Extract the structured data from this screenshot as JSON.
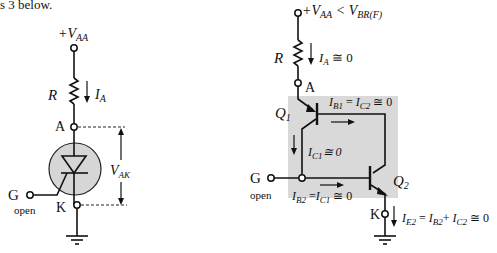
{
  "header_fragment": "s 3 below.",
  "left_circuit": {
    "supply_label": "+V",
    "supply_sub": "AA",
    "resistor_label": "R",
    "current_label": "I",
    "current_sub": "A",
    "anode_label": "A",
    "cathode_label": "K",
    "gate_label": "G",
    "gate_state": "open",
    "voltage_label": "V",
    "voltage_sub": "AK",
    "device_fill": "#d6d6d6"
  },
  "right_circuit": {
    "supply_label": "+V",
    "supply_sub": "AA",
    "supply_cond": " < V",
    "supply_cond_sub": "BR(F)",
    "resistor_label": "R",
    "current_label": "I",
    "current_sub": "A",
    "current_value": " ≅ 0",
    "anode_label": "A",
    "q1_label": "Q",
    "q1_sub": "1",
    "q2_label": "Q",
    "q2_sub": "2",
    "ib1_eq": {
      "a": "I",
      "a_sub": "B1",
      "mid": " = ",
      "b": "I",
      "b_sub": "C2",
      "tail": " ≅ 0"
    },
    "ic1_eq": {
      "a": "I",
      "a_sub": "C1",
      "tail": "≅ 0"
    },
    "ib2_eq": {
      "a": "I",
      "a_sub": "B2",
      "mid": " =",
      "b": "I",
      "b_sub": "C1",
      "tail": " ≅ 0"
    },
    "ie2_eq": {
      "a": "I",
      "a_sub": "E2",
      "mid": " = ",
      "b": "I",
      "b_sub": "B2",
      "mid2": "+ ",
      "c": "I",
      "c_sub": "C2",
      "tail": " ≅ 0"
    },
    "gate_label": "G",
    "gate_state": "open",
    "cathode_label": "K",
    "shade_fill": "#d9d9d9"
  }
}
